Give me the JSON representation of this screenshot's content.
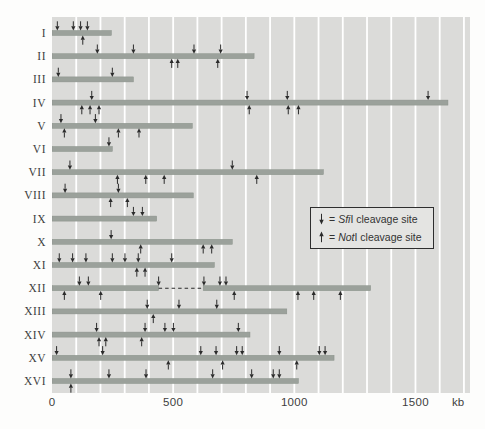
{
  "figure": {
    "axis": {
      "tick_labels": [
        "0",
        "500",
        "1000",
        "1500"
      ],
      "tick_values": [
        0,
        500,
        1000,
        1500
      ],
      "unit_label": "kb",
      "max_kb": 1725,
      "grid_interval_kb": 100
    },
    "legend": {
      "rows": [
        {
          "symbol": "down-arrow",
          "eq": "=",
          "enzyme": "Sfi",
          "rest": "I cleavage site"
        },
        {
          "symbol": "up-arrow",
          "eq": "=",
          "enzyme": "Not",
          "rest": "I cleavage site"
        }
      ]
    },
    "colors": {
      "plot_bg": "#dbdbd9",
      "gridline": "#ffffff",
      "bar": "#9ba19b",
      "bar_edge": "#8a918a",
      "arrow": "#2b2b2b",
      "text": "#3e3e3e",
      "legend_bg": "#e4e4e2",
      "legend_border": "#2e2e2e"
    }
  },
  "chart_data": {
    "type": "bar",
    "orientation": "horizontal",
    "xlabel": "kb",
    "xlim": [
      0,
      1725
    ],
    "grid": true,
    "legend_position": "middle-right",
    "categories": [
      "I",
      "II",
      "III",
      "IV",
      "V",
      "VI",
      "VII",
      "VIII",
      "IX",
      "X",
      "XI",
      "XII",
      "XIII",
      "XIV",
      "XV",
      "XVI"
    ],
    "chromosomes": [
      {
        "name": "I",
        "length_kb": 245,
        "sfiI_sites_kb": [
          22,
          88,
          118,
          146
        ],
        "notI_sites_kb": [
          127
        ]
      },
      {
        "name": "II",
        "length_kb": 834,
        "sfiI_sites_kb": [
          187,
          336,
          586,
          696
        ],
        "notI_sites_kb": [
          494,
          519,
          684
        ]
      },
      {
        "name": "III",
        "length_kb": 336,
        "sfiI_sites_kb": [
          26,
          249
        ],
        "notI_sites_kb": []
      },
      {
        "name": "IV",
        "length_kb": 1634,
        "sfiI_sites_kb": [
          164,
          805,
          971,
          1552
        ],
        "notI_sites_kb": [
          123,
          157,
          194,
          814,
          975,
          1017
        ]
      },
      {
        "name": "V",
        "length_kb": 579,
        "sfiI_sites_kb": [
          37,
          179
        ],
        "notI_sites_kb": [
          51,
          274,
          359
        ]
      },
      {
        "name": "VI",
        "length_kb": 249,
        "sfiI_sites_kb": [
          235
        ],
        "notI_sites_kb": []
      },
      {
        "name": "VII",
        "length_kb": 1120,
        "sfiI_sites_kb": [
          74,
          744
        ],
        "notI_sites_kb": [
          270,
          387,
          463,
          845
        ]
      },
      {
        "name": "VIII",
        "length_kb": 583,
        "sfiI_sites_kb": [
          54,
          274
        ],
        "notI_sites_kb": [
          242,
          311
        ]
      },
      {
        "name": "IX",
        "length_kb": 432,
        "sfiI_sites_kb": [
          336,
          373
        ],
        "notI_sites_kb": []
      },
      {
        "name": "X",
        "length_kb": 744,
        "sfiI_sites_kb": [
          244
        ],
        "notI_sites_kb": [
          366,
          624,
          659
        ]
      },
      {
        "name": "XI",
        "length_kb": 670,
        "sfiI_sites_kb": [
          30,
          85,
          140,
          249,
          301,
          356,
          494
        ],
        "notI_sites_kb": [
          350,
          384
        ]
      },
      {
        "name": "XII",
        "length_kb": 1315,
        "gap_dashed_kb": [
          440,
          624
        ],
        "sfiI_sites_kb": [
          113,
          150,
          440,
          627,
          693,
          718
        ],
        "notI_sites_kb": [
          51,
          201,
          752,
          1015,
          1080,
          1190
        ]
      },
      {
        "name": "XIII",
        "length_kb": 969,
        "sfiI_sites_kb": [
          393,
          524,
          680
        ],
        "notI_sites_kb": [
          418
        ]
      },
      {
        "name": "XIV",
        "length_kb": 817,
        "sfiI_sites_kb": [
          184,
          384,
          466,
          501,
          769
        ],
        "notI_sites_kb": [
          194,
          222,
          370
        ]
      },
      {
        "name": "XV",
        "length_kb": 1164,
        "sfiI_sites_kb": [
          19,
          209,
          614,
          677,
          762,
          785,
          938,
          1103,
          1127
        ],
        "notI_sites_kb": [
          480,
          704,
          1010
        ]
      },
      {
        "name": "XVI",
        "length_kb": 1017,
        "sfiI_sites_kb": [
          78,
          235,
          388,
          663,
          824,
          913,
          938
        ],
        "notI_sites_kb": [
          78
        ]
      }
    ]
  }
}
